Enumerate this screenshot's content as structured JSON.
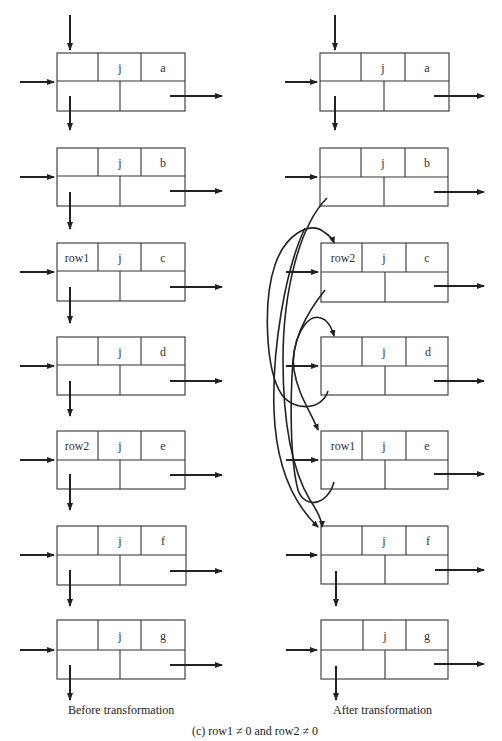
{
  "figure": {
    "caption": "(c)  row1 ≠ 0 and row2 ≠ 0",
    "left_label": "Before transformation",
    "right_label": "After transformation"
  },
  "before": {
    "nodes": [
      {
        "row": "",
        "col": "j",
        "value": "a"
      },
      {
        "row": "",
        "col": "j",
        "value": "b"
      },
      {
        "row": "row1",
        "col": "j",
        "value": "c"
      },
      {
        "row": "",
        "col": "j",
        "value": "d"
      },
      {
        "row": "row2",
        "col": "j",
        "value": "e"
      },
      {
        "row": "",
        "col": "j",
        "value": "f"
      },
      {
        "row": "",
        "col": "j",
        "value": "g"
      }
    ]
  },
  "after": {
    "nodes": [
      {
        "row": "",
        "col": "j",
        "value": "a"
      },
      {
        "row": "",
        "col": "j",
        "value": "b"
      },
      {
        "row": "row2",
        "col": "j",
        "value": "c"
      },
      {
        "row": "",
        "col": "j",
        "value": "d"
      },
      {
        "row": "row1",
        "col": "j",
        "value": "e"
      },
      {
        "row": "",
        "col": "j",
        "value": "f"
      },
      {
        "row": "",
        "col": "j",
        "value": "g"
      }
    ]
  }
}
